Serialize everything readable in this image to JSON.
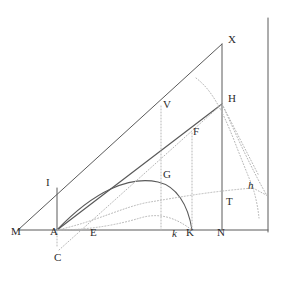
{
  "figure": {
    "width": 291,
    "height": 286,
    "background_color": "#ffffff",
    "solid_stroke_color": "#5a5a5a",
    "dotted_stroke_color": "#b0b0b0",
    "label_color": "#2b2b2b"
  },
  "labels": [
    {
      "name": "label-M",
      "text": "M",
      "x": 11,
      "y": 232,
      "italic": false
    },
    {
      "name": "label-A",
      "text": "A",
      "x": 50,
      "y": 232,
      "italic": false
    },
    {
      "name": "label-E",
      "text": "E",
      "x": 90,
      "y": 233,
      "italic": false
    },
    {
      "name": "label-C",
      "text": "C",
      "x": 54,
      "y": 256,
      "italic": false
    },
    {
      "name": "label-I",
      "text": "I",
      "x": 46,
      "y": 180,
      "italic": false
    },
    {
      "name": "label-G",
      "text": "G",
      "x": 163,
      "y": 172,
      "italic": false
    },
    {
      "name": "label-V",
      "text": "V",
      "x": 163,
      "y": 102,
      "italic": false
    },
    {
      "name": "label-F",
      "text": "F",
      "x": 193,
      "y": 129,
      "italic": false
    },
    {
      "name": "label-X",
      "text": "X",
      "x": 228,
      "y": 38,
      "italic": false
    },
    {
      "name": "label-H",
      "text": "H",
      "x": 228,
      "y": 97,
      "italic": false
    },
    {
      "name": "label-T",
      "text": "T",
      "x": 226,
      "y": 198,
      "italic": false
    },
    {
      "name": "label-N",
      "text": "N",
      "x": 218,
      "y": 233,
      "italic": false
    },
    {
      "name": "label-k",
      "text": "k",
      "x": 172,
      "y": 233,
      "italic": true
    },
    {
      "name": "label-K",
      "text": "K",
      "x": 186,
      "y": 232,
      "italic": false
    },
    {
      "name": "label-h",
      "text": "h",
      "x": 248,
      "y": 182,
      "italic": true
    }
  ],
  "points": {
    "M": [
      18,
      230
    ],
    "A": [
      57,
      230
    ],
    "E": [
      95,
      230
    ],
    "C": [
      59,
      250
    ],
    "I": [
      57,
      188
    ],
    "G": [
      158,
      182
    ],
    "V": [
      161,
      112
    ],
    "F": [
      191,
      140
    ],
    "X": [
      222,
      44
    ],
    "H": [
      222,
      104
    ],
    "T": [
      222,
      203
    ],
    "N": [
      222,
      230
    ],
    "k": [
      176,
      230
    ],
    "K": [
      192,
      230
    ],
    "h": [
      253,
      188
    ],
    "baseline_right_end": [
      268,
      230
    ],
    "axis_top": [
      268,
      18
    ]
  },
  "solid_paths": {
    "baseline_MN": "M 18 230 L 268 230",
    "hypotenuse_MX": "M 18 230 L 222 44",
    "vertical_XN": "M 222 44 L 222 230",
    "chord_AH": "M 57 230 L 222 104",
    "vertical_AI": "M 57 230 L 57 188",
    "right_axis": "M 268 18 L 268 232",
    "curve_AGK": "M 57 230 C 95 190 130 176 158 182 C 176 186 188 204 192 230"
  },
  "dotted_paths": {
    "vertical_V": "M 161 230 L 161 105",
    "vertical_F_to_K": "M 192 230 L 192 133",
    "vertical_A_to_C": "M 57 230 L 57 248",
    "line_C_through_E_to_H": "M 59 250 L 222 104",
    "arc_A_mid": "M 57 230 C 95 222 125 206 150 202 C 175 198 200 192 253 188",
    "arc_A_low": "M 57 230 C 92 230 120 224 140 218 C 160 212 176 218 192 230",
    "curve_through_H_down": "M 196 78 C 212 90 222 110 234 140 C 244 166 250 180 253 188",
    "curve_h_down": "M 253 188 C 256 198 258 208 259 216",
    "line_H_to_h_right": "M 222 104 C 232 128 244 160 264 196",
    "line_H_to_far_right": "M 222 104 L 270 176",
    "line_h_to_right_edge": "M 253 188 L 268 196"
  }
}
